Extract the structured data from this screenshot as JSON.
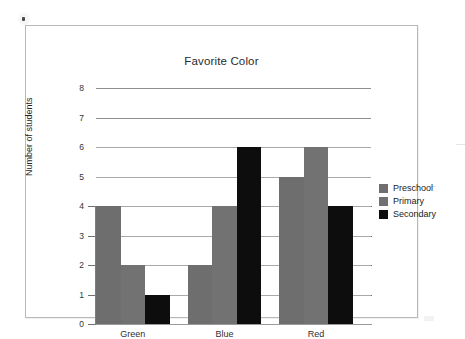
{
  "chart_data": {
    "type": "bar",
    "title": "Favorite Color",
    "xlabel": "",
    "ylabel": "Number of students",
    "categories": [
      "Green",
      "Blue",
      "Red"
    ],
    "series": [
      {
        "name": "Preschool",
        "color": "#6e6e6e",
        "values": [
          4,
          2,
          5
        ]
      },
      {
        "name": "Primary",
        "color": "#727272",
        "values": [
          2,
          4,
          6
        ]
      },
      {
        "name": "Secondary",
        "color": "#0d0d0d",
        "values": [
          1,
          6,
          4
        ]
      }
    ],
    "ylim": [
      0,
      8
    ],
    "yticks": [
      0,
      1,
      2,
      3,
      4,
      5,
      6,
      7,
      8
    ],
    "ytick_labels": [
      "0",
      "1",
      "2",
      "3",
      "4",
      "5",
      "6",
      "7",
      "8"
    ],
    "grid": true,
    "grid_axis": "y",
    "legend_position": "right"
  },
  "legend": {
    "items": [
      {
        "label": "Preschool",
        "color": "#6e6e6e"
      },
      {
        "label": "Primary",
        "color": "#727272"
      },
      {
        "label": "Secondary",
        "color": "#0d0d0d"
      }
    ]
  }
}
